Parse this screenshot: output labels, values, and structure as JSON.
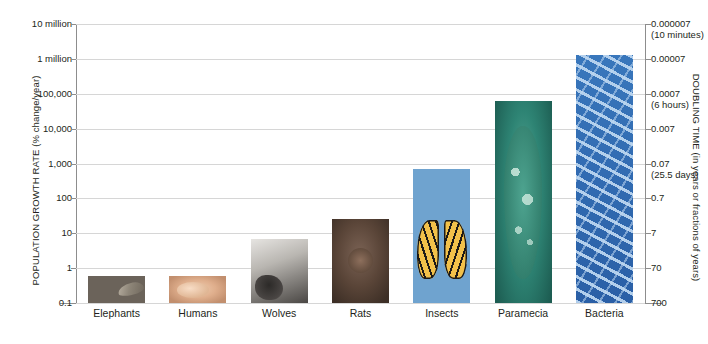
{
  "chart_data": {
    "type": "bar",
    "title": "",
    "categories": [
      "Elephants",
      "Humans",
      "Wolves",
      "Rats",
      "Insects",
      "Paramecia",
      "Bacteria"
    ],
    "values": [
      0.6,
      0.6,
      7,
      25,
      700,
      60000,
      1300000
    ],
    "xlabel": "",
    "ylabel": "POPULATION GROWTH RATE (% change/year)",
    "y2label": "DOUBLING TIME (in years or fractions of years)",
    "yscale": "log",
    "ylim": [
      0.1,
      10000000
    ],
    "grid": true,
    "legend": "none",
    "yticks": [
      {
        "value": 10000000,
        "label": "10 million"
      },
      {
        "value": 1000000,
        "label": "1 million"
      },
      {
        "value": 100000,
        "label": "100,000"
      },
      {
        "value": 10000,
        "label": "10,000"
      },
      {
        "value": 1000,
        "label": "1,000"
      },
      {
        "value": 100,
        "label": "100"
      },
      {
        "value": 10,
        "label": "10"
      },
      {
        "value": 1,
        "label": "1"
      },
      {
        "value": 0.1,
        "label": "0.1"
      }
    ],
    "y2ticks": [
      {
        "label": "0.000007",
        "sublabel": "(10 minutes)"
      },
      {
        "label": "0.00007",
        "sublabel": ""
      },
      {
        "label": "0.0007",
        "sublabel": "(6 hours)"
      },
      {
        "label": "0.007",
        "sublabel": ""
      },
      {
        "label": "0.07",
        "sublabel": "(25.5 days)"
      },
      {
        "label": "0.7",
        "sublabel": ""
      },
      {
        "label": "7",
        "sublabel": ""
      },
      {
        "label": "70",
        "sublabel": ""
      },
      {
        "label": "700",
        "sublabel": ""
      }
    ],
    "bar_colors": [
      "#6b635a",
      "#e3b794",
      "#b0aeaa",
      "#5d4839",
      "#6fa3cf",
      "#2a7a6b",
      "#2f6ab4"
    ],
    "bar_images": [
      "elephant-photo",
      "human-baby-photo",
      "wolf-photo",
      "rat-photo",
      "butterfly-photo",
      "paramecium-photo",
      "bacteria-photo"
    ]
  }
}
